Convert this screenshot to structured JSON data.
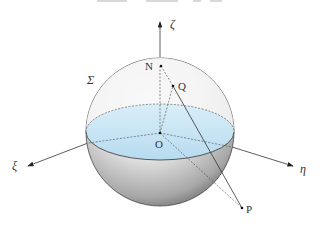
{
  "diagram": {
    "type": "stereographic-projection-sphere",
    "sphere_label": "Σ",
    "axes": {
      "xi": "ξ",
      "eta": "η",
      "zeta": "ζ"
    },
    "points": {
      "north_pole": "N",
      "sphere_point": "Q",
      "center": "O",
      "plane_point": "P"
    },
    "colors": {
      "equatorial_fill": "#bfe0f2",
      "sphere_shade": "#9a9a9a",
      "line": "#333333"
    }
  }
}
